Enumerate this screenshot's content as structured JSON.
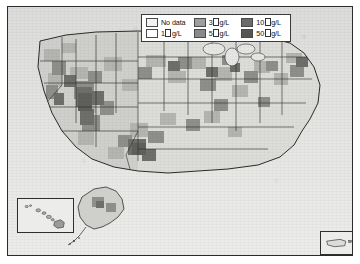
{
  "figure": {
    "name": "us-county-choropleth-map",
    "frame_color": "#2b2b2b",
    "background_color": "#e8e8e6"
  },
  "legend": {
    "name": "map-legend",
    "unit": "g/L",
    "micro_glyph": "tofu-box",
    "items": [
      {
        "label": "No data",
        "value": null,
        "color": "#f2f2f0",
        "has_unit": false
      },
      {
        "label": "3",
        "value": 3,
        "color": "#9e9e9c",
        "has_unit": true
      },
      {
        "label": "10",
        "value": 10,
        "color": "#6a6a68",
        "has_unit": true
      },
      {
        "label": "1",
        "value": 1,
        "color": "#ffffff",
        "has_unit": true
      },
      {
        "label": "5",
        "value": 5,
        "color": "#8a8a88",
        "has_unit": true
      },
      {
        "label": "50",
        "value": 50,
        "color": "#555553",
        "has_unit": true
      }
    ]
  },
  "insets": [
    {
      "name": "hawaii-inset",
      "label": "Hawaii"
    },
    {
      "name": "alaska-inset",
      "label": "Alaska"
    },
    {
      "name": "puerto-rico-inset",
      "label": "Puerto Rico"
    }
  ],
  "map_data": {
    "type": "choropleth",
    "geography": "United States counties",
    "classes": [
      "No data",
      "1",
      "3",
      "5",
      "10",
      "50"
    ],
    "color_ramp": [
      "#f2f2f0",
      "#ffffff",
      "#9e9e9c",
      "#8a8a88",
      "#6a6a68",
      "#555553"
    ],
    "high_value_regions": [
      "Nevada",
      "Utah",
      "Arizona",
      "California Central Valley",
      "west Texas",
      "Upper Midwest",
      "New England"
    ],
    "low_value_regions": [
      "Southeast",
      "Mid-Atlantic",
      "Gulf Coast"
    ]
  }
}
